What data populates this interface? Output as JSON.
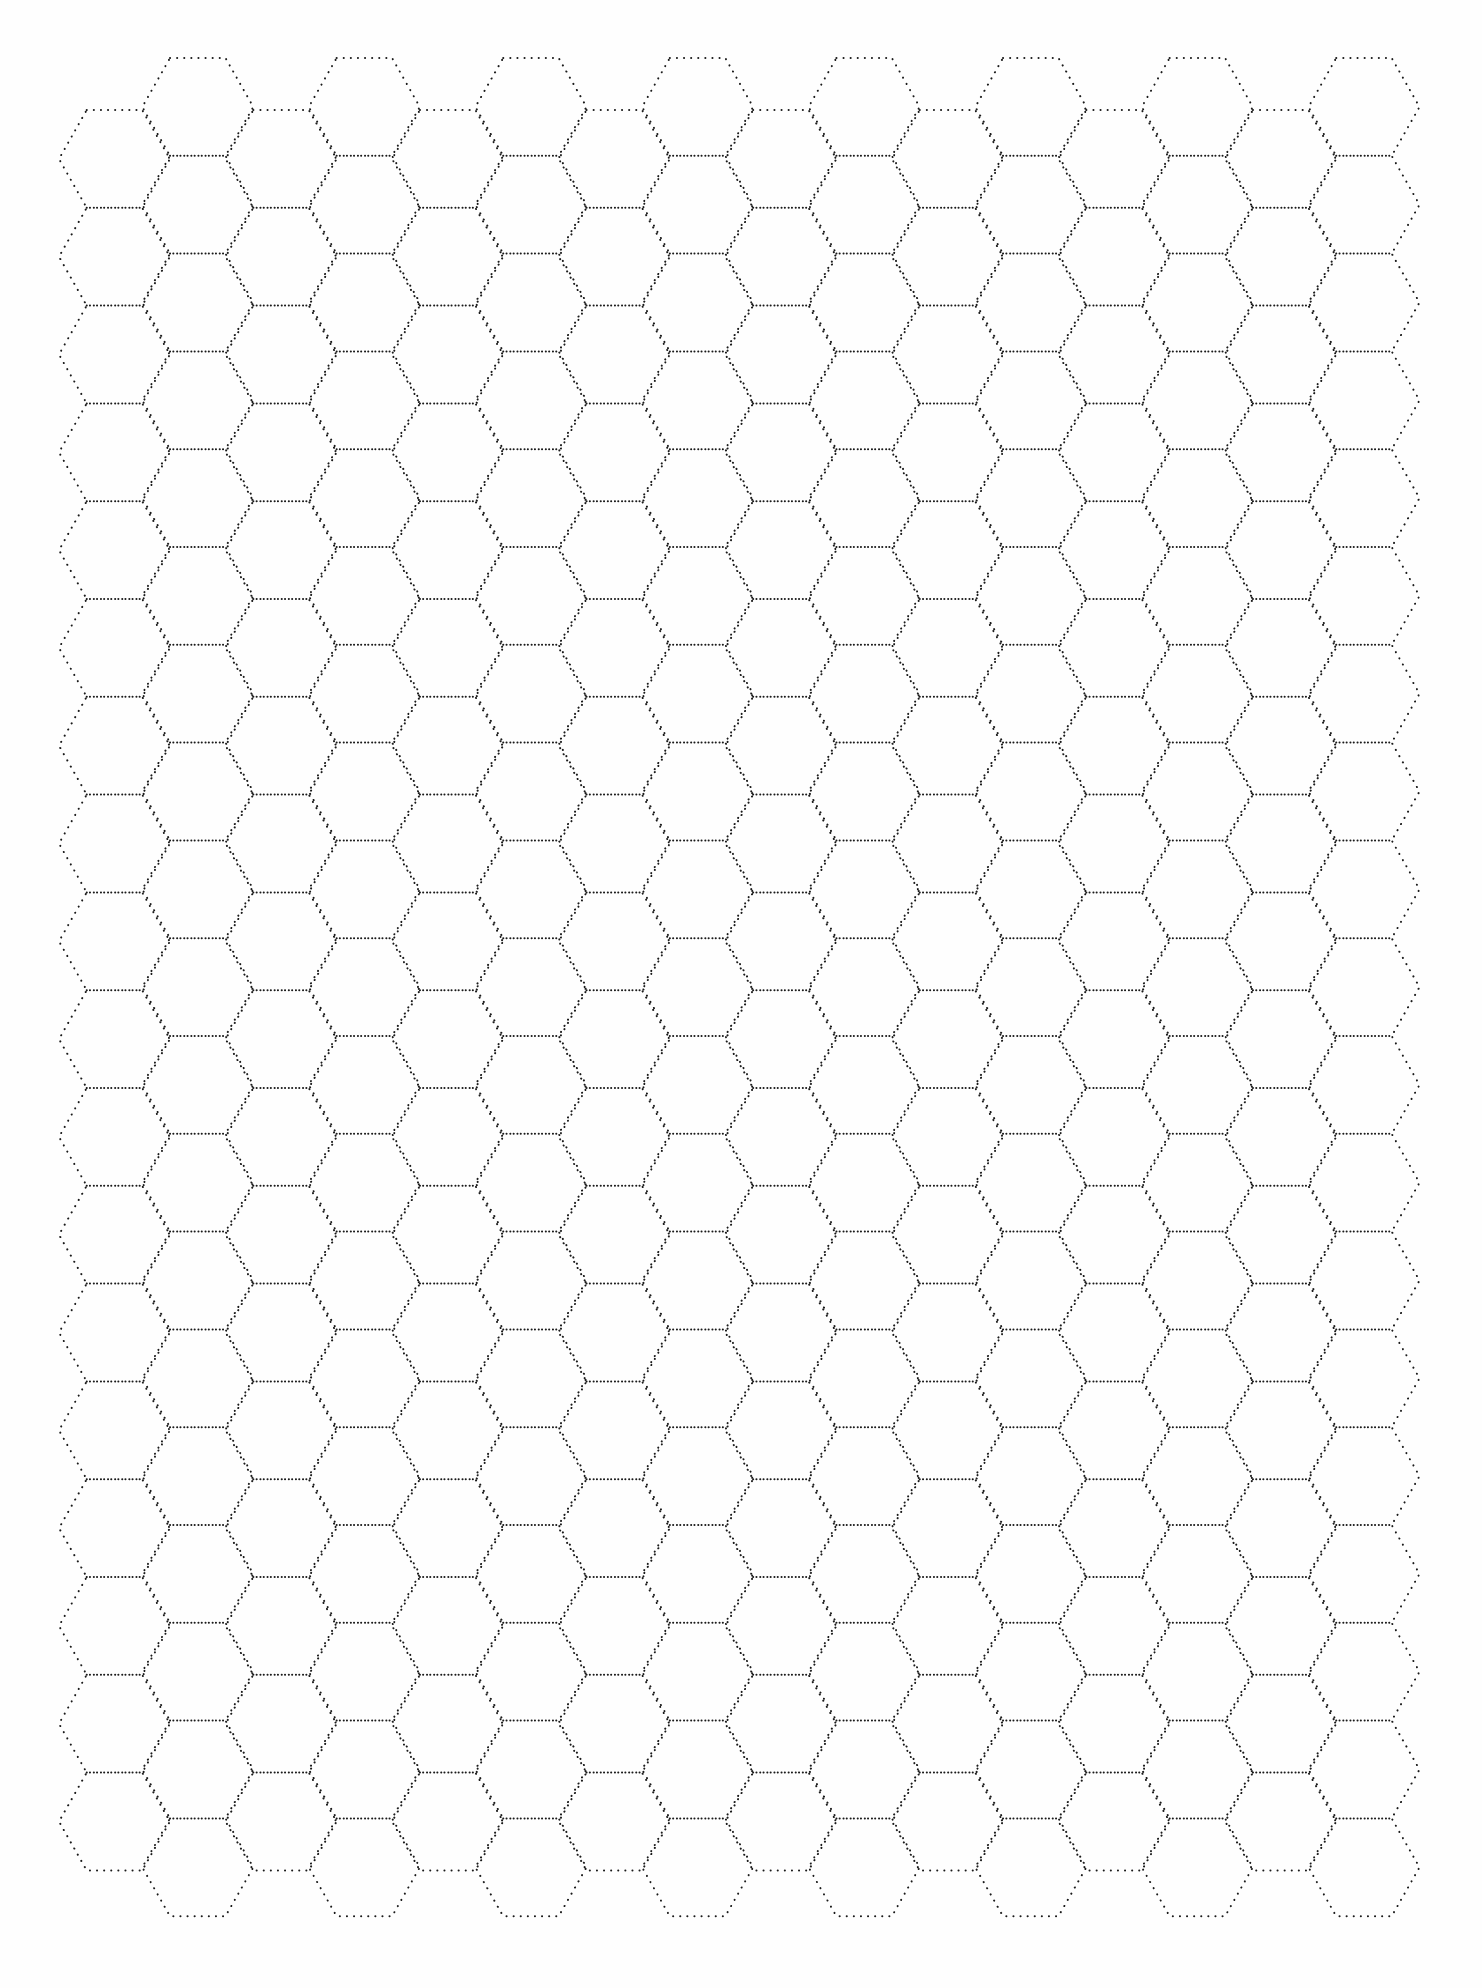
{
  "page": {
    "background": "#ffffff",
    "line_color": "#1a1a1a",
    "line_style": "dotted"
  },
  "hex_grid": {
    "orientation": "flat-top",
    "columns": 16,
    "rows_even_columns": 18,
    "rows_odd_columns": 19,
    "side_px": 55.5,
    "column_pitch_px": 83.3,
    "row_pitch_px": 97.8,
    "origin_even_top_left_x": 86.7,
    "origin_even_top_y": 110,
    "origin_odd_top_y": 58
  }
}
